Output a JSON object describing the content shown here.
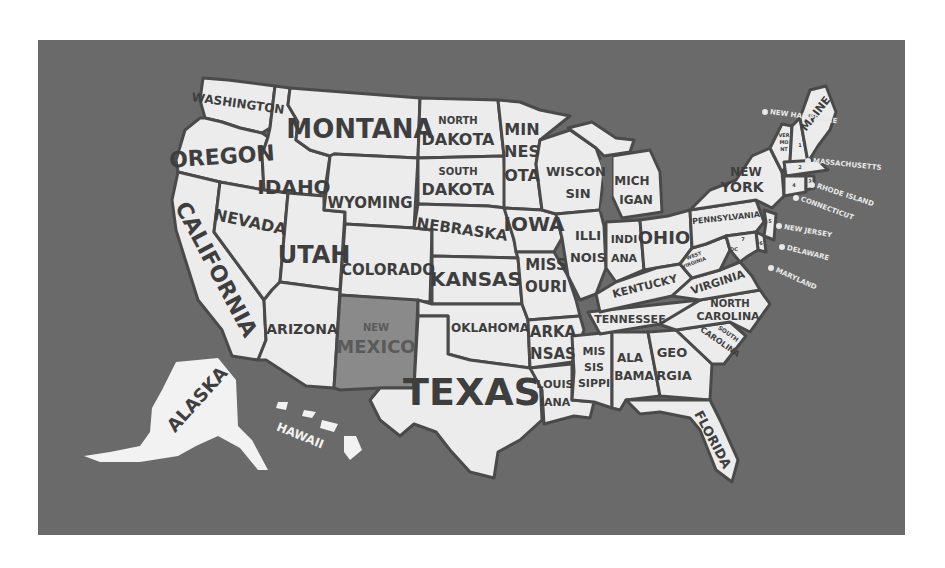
{
  "map": {
    "title": "United States map with state names",
    "highlighted_state": "New Mexico",
    "colors": {
      "page_background": "#ffffff",
      "panel_background": "#6a6a6a",
      "state_fill": "#ececec",
      "state_border": "#4a4a4a",
      "highlight_fill": "#8a8a8a",
      "label_text": "#3e3e3e",
      "northeast_label_text": "#e8e8e8"
    },
    "states": {
      "washington": "WASHINGTON",
      "oregon": "OREGON",
      "california": "CALIFORNIA",
      "idaho": "IDAHO",
      "nevada": "NEVADA",
      "montana": "MONTANA",
      "wyoming": "WYOMING",
      "utah": "UTAH",
      "arizona": "ARIZONA",
      "colorado": "COLORADO",
      "new_mexico_1": "NEW",
      "new_mexico_2": "MEXICO",
      "north_dakota_1": "NORTH",
      "north_dakota_2": "DAKOTA",
      "south_dakota_1": "SOUTH",
      "south_dakota_2": "DAKOTA",
      "nebraska": "NEBRASKA",
      "kansas": "KANSAS",
      "oklahoma": "OKLAHOMA",
      "texas": "TEXAS",
      "minnesota_1": "MIN",
      "minnesota_2": "NES",
      "minnesota_3": "OTA",
      "iowa": "IOWA",
      "missouri_1": "MISS",
      "missouri_2": "OURI",
      "arkansas_1": "ARKA",
      "arkansas_2": "NSAS",
      "louisiana_1": "LOUIS",
      "louisiana_2": "IANA",
      "wisconsin_1": "WISCON",
      "wisconsin_2": "SIN",
      "illinois_1": "ILLI",
      "illinois_2": "NOIS",
      "michigan_1": "MICH",
      "michigan_2": "IGAN",
      "indiana_1": "INDI",
      "indiana_2": "ANA",
      "ohio": "OHIO",
      "kentucky": "KENTUCKY",
      "tennessee": "TENNESSEE",
      "mississippi_1": "MIS",
      "mississippi_2": "SIS",
      "mississippi_3": "SIPPI",
      "alabama_1": "ALA",
      "alabama_2": "BAMA",
      "georgia_1": "GEO",
      "georgia_2": "RGIA",
      "florida": "FLORIDA",
      "south_carolina_1": "SOUTH",
      "south_carolina_2": "CAROLINA",
      "north_carolina_1": "NORTH",
      "north_carolina_2": "CAROLINA",
      "virginia": "VIRGINIA",
      "west_virginia_1": "WEST",
      "west_virginia_2": "VIRGINIA",
      "dc": "DC",
      "pennsylvania": "PENNSYLVANIA",
      "new_york_1": "NEW",
      "new_york_2": "YORK",
      "vermont_1": "VER",
      "vermont_2": "MO",
      "vermont_3": "NT",
      "maine": "MAINE",
      "alaska": "ALASKA",
      "hawaii": "HAWAII"
    },
    "northeast_callouts": [
      {
        "num": "1",
        "label": "NEW HAMPSHIRE"
      },
      {
        "num": "2",
        "label": "MASSACHUSETTS"
      },
      {
        "num": "3",
        "label": "RHODE ISLAND"
      },
      {
        "num": "4",
        "label": "CONNECTICUT"
      },
      {
        "num": "5",
        "label": "NEW JERSEY"
      },
      {
        "num": "6",
        "label": "DELAWARE"
      },
      {
        "num": "7",
        "label": "MARYLAND"
      }
    ],
    "map_numbers": {
      "n1": "1",
      "n2": "2",
      "n3": "3",
      "n4": "4",
      "n5": "5",
      "n6": "6",
      "n7": "7"
    }
  }
}
